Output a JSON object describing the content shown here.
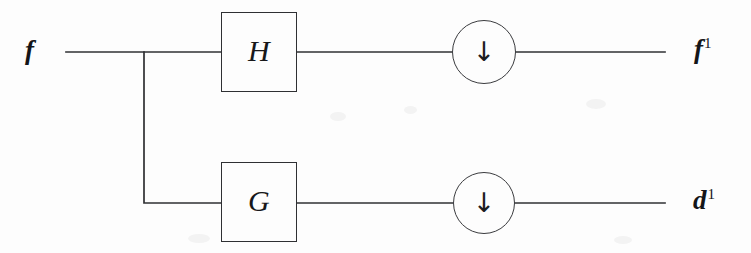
{
  "figure": {
    "background_color": "#fdfdfd",
    "ink_color": "#2f3033"
  },
  "input": {
    "label": "f",
    "name": "input-signal"
  },
  "filters": [
    {
      "id": "highpass-box-h",
      "label": "H",
      "x": 221,
      "y": 12,
      "width": 76,
      "height": 80
    },
    {
      "id": "lowpass-box-g",
      "label": "G",
      "x": 221,
      "y": 162,
      "width": 76,
      "height": 80
    }
  ],
  "downsamplers": [
    {
      "id": "downsampler-top",
      "glyph": "↓",
      "icon_name": "down-arrow-icon",
      "cx": 484,
      "cy": 52,
      "r": 32
    },
    {
      "id": "downsampler-bottom",
      "glyph": "↓",
      "icon_name": "down-arrow-icon",
      "cx": 484,
      "cy": 203,
      "r": 31
    }
  ],
  "outputs": [
    {
      "id": "output-f1",
      "base": "f",
      "superscript": "1"
    },
    {
      "id": "output-d1",
      "base": "d",
      "superscript": "1"
    }
  ],
  "wires": {
    "top_y": 52,
    "bottom_y": 203,
    "split_x": 144,
    "input_start_x": 66,
    "output_end_x": 665,
    "stroke_width": 1.7,
    "color": "#2f3033"
  }
}
